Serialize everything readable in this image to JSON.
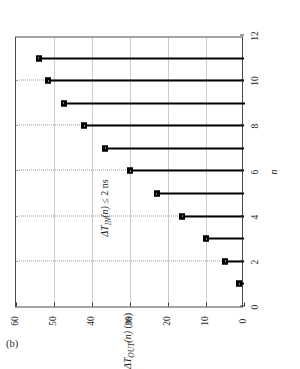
{
  "figure": {
    "panel_caption": "(b)",
    "annotation": {
      "delta": "Δ",
      "t_symbol": "T",
      "subscript": "IN",
      "arg": "(n)",
      "relation": "≤ 2 ns",
      "full_text": "ΔT_IN(n) ≤ 2 ns"
    }
  },
  "chart_data": {
    "type": "bar",
    "orientation": "stem-horizontal-rotated",
    "title": "",
    "xlabel": "n",
    "ylabel": "ΔT_OUT(n) (ns)",
    "ylabel_parts": {
      "delta": "Δ",
      "t_symbol": "T",
      "subscript": "OUT",
      "arg": "(n)",
      "units": "(ns)"
    },
    "xlim": [
      0,
      12
    ],
    "ylim": [
      0,
      60
    ],
    "xticks": [
      0,
      2,
      4,
      6,
      8,
      10,
      12
    ],
    "xtick_labels": [
      "0",
      "2",
      "4",
      "6",
      "8",
      "10",
      "12"
    ],
    "yticks": [
      0,
      10,
      20,
      30,
      40,
      50,
      60
    ],
    "ytick_labels": [
      "0",
      "10",
      "20",
      "30",
      "40",
      "50",
      "60"
    ],
    "grid": true,
    "legend": null,
    "categories": [
      1,
      2,
      3,
      4,
      5,
      6,
      7,
      8,
      9,
      10,
      11
    ],
    "values": [
      1.3,
      5.0,
      10.0,
      16.3,
      23.0,
      30.0,
      36.5,
      42.0,
      47.5,
      51.5,
      54.0
    ],
    "points": [
      {
        "n": 1,
        "value": 1.3
      },
      {
        "n": 2,
        "value": 5.0
      },
      {
        "n": 3,
        "value": 10.0
      },
      {
        "n": 4,
        "value": 16.3
      },
      {
        "n": 5,
        "value": 23.0
      },
      {
        "n": 6,
        "value": 30.0
      },
      {
        "n": 7,
        "value": 36.5
      },
      {
        "n": 8,
        "value": 42.0
      },
      {
        "n": 9,
        "value": 47.5
      },
      {
        "n": 10,
        "value": 51.5
      },
      {
        "n": 11,
        "value": 54.0
      }
    ],
    "colors": {
      "stem": "#000000",
      "marker": "#000000",
      "grid": "#9a9a9a",
      "frame": "#4a4a4a",
      "background": "#ffffff"
    }
  }
}
